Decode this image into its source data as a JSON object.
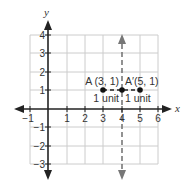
{
  "figure": {
    "axis_titles": {
      "x": "x",
      "y": "y"
    },
    "x_ticks": [
      {
        "value": -1,
        "label": "−1"
      },
      {
        "value": 1,
        "label": "1"
      },
      {
        "value": 2,
        "label": "2"
      },
      {
        "value": 3,
        "label": "3"
      },
      {
        "value": 4,
        "label": "4"
      },
      {
        "value": 5,
        "label": "5"
      },
      {
        "value": 6,
        "label": "6"
      }
    ],
    "y_ticks": [
      {
        "value": 4,
        "label": "4"
      },
      {
        "value": 3,
        "label": "3"
      },
      {
        "value": 2,
        "label": "2"
      },
      {
        "value": 1,
        "label": "1"
      },
      {
        "value": -1,
        "label": "−1"
      },
      {
        "value": -2,
        "label": "−2"
      },
      {
        "value": -3,
        "label": "−3"
      }
    ],
    "points": [
      {
        "name": "A",
        "label": "A (3, 1)",
        "x": 3,
        "y": 1
      },
      {
        "name": "A'",
        "label": "A′(5, 1)",
        "x": 5,
        "y": 1
      }
    ],
    "reflection_line": {
      "x": 4,
      "style": "dashed",
      "arrows": "both"
    },
    "distance_labels": [
      "1 unit",
      "1 unit"
    ],
    "colors": {
      "grid": "#cccccc",
      "axis": "#222222",
      "point": "#111111",
      "dashed": "#777777",
      "text": "#333333"
    }
  }
}
